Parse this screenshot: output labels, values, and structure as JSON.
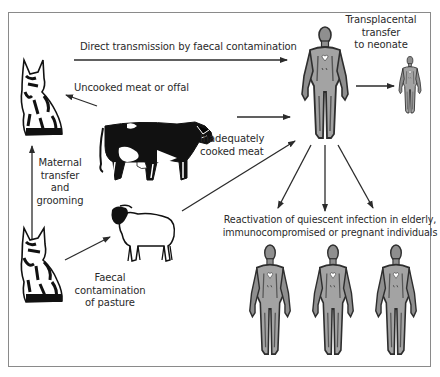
{
  "diagram": {
    "nodes": {
      "cat_top": {
        "label": "Cat (definitive host)",
        "icon": "cat-icon"
      },
      "cat_bottom": {
        "label": "Cat (kitten)",
        "icon": "cat-icon"
      },
      "cow": {
        "label": "Cow",
        "icon": "cow-icon"
      },
      "sheep": {
        "label": "Sheep",
        "icon": "sheep-icon"
      },
      "human_adult": {
        "label": "Human",
        "icon": "human-figure-icon"
      },
      "neonate": {
        "label": "Neonate",
        "icon": "human-figure-icon"
      },
      "humans_bottom": [
        {
          "label": "Elderly individual",
          "icon": "human-figure-icon"
        },
        {
          "label": "Immunocompromised individual",
          "icon": "human-figure-icon"
        },
        {
          "label": "Pregnant individual",
          "icon": "human-figure-icon"
        }
      ]
    },
    "edges": {
      "direct": {
        "label": "Direct transmission by faecal contamination",
        "from": "cat_top",
        "to": "human_adult"
      },
      "uncooked": {
        "label": "Uncooked meat or offal",
        "from": "cow",
        "to": "cat_top"
      },
      "inadequate": {
        "lines": [
          "Inadequately",
          "cooked meat"
        ],
        "from": "cow",
        "to": "human_adult"
      },
      "maternal": {
        "lines": [
          "Maternal",
          "transfer",
          "and",
          "grooming"
        ],
        "from": "cat_top",
        "to": "cat_bottom",
        "bidirectional": true
      },
      "pasture": {
        "lines": [
          "Faecal",
          "contamination",
          "of pasture"
        ],
        "from": "cat_bottom",
        "to": "sheep"
      },
      "sheep_to_human": {
        "label": "",
        "from": "sheep",
        "to": "human_adult"
      },
      "transplacental": {
        "lines": [
          "Transplacental",
          "transfer",
          "to neonate"
        ],
        "from": "human_adult",
        "to": "neonate"
      },
      "reactivation": {
        "lines": [
          "Reactivation of quiescent infection in elderly,",
          "immunocompromised or pregnant individuals"
        ],
        "from": "human_adult",
        "to": "humans_bottom"
      }
    },
    "colors": {
      "line": "#2b2b2b",
      "frame": "#8a8a8a",
      "human_fill": "#9a9a9a",
      "human_dark": "#3a3a3a",
      "animal_black": "#111111"
    }
  }
}
